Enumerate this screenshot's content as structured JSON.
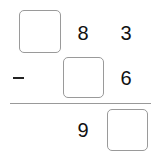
{
  "problem": {
    "operation": "subtraction",
    "operator_symbol": "minus",
    "row1": {
      "tens_box": "",
      "ones_digit_a": "8",
      "ones_digit_b": "3"
    },
    "row2": {
      "box": "",
      "digit": "6"
    },
    "result": {
      "digit": "9",
      "box": ""
    }
  }
}
